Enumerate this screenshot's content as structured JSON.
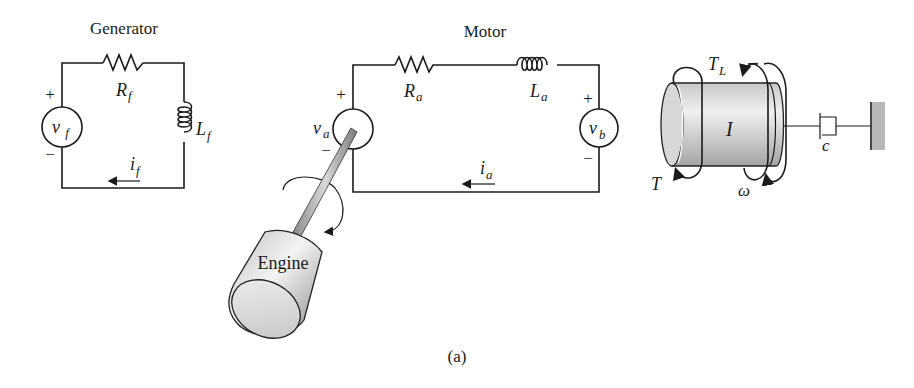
{
  "figure": {
    "caption": "(a)",
    "colors": {
      "line": "#1a1a1a",
      "cylinder_light": "#e8e8e8",
      "cylinder_dark": "#9a9a9a",
      "wall": "#b0b0b0",
      "background": "#ffffff"
    }
  },
  "generator": {
    "title": "Generator",
    "source": {
      "symbol": "v",
      "sub": "f",
      "plus": "+",
      "minus": "−"
    },
    "resistor": {
      "symbol": "R",
      "sub": "f"
    },
    "inductor": {
      "symbol": "L",
      "sub": "f"
    },
    "current": {
      "symbol": "i",
      "sub": "f",
      "direction": "left"
    }
  },
  "motor": {
    "title": "Motor",
    "armature_source": {
      "symbol": "v",
      "sub": "a",
      "plus": "+",
      "minus": "−"
    },
    "back_emf_source": {
      "symbol": "v",
      "sub": "b",
      "plus": "+",
      "minus": "−"
    },
    "resistor": {
      "symbol": "R",
      "sub": "a"
    },
    "inductor": {
      "symbol": "L",
      "sub": "a"
    },
    "current": {
      "symbol": "i",
      "sub": "a",
      "direction": "left"
    }
  },
  "engine": {
    "label": "Engine"
  },
  "load": {
    "inertia": "I",
    "load_torque": {
      "symbol": "T",
      "sub": "L"
    },
    "input_torque": {
      "symbol": "T"
    },
    "angular_velocity": {
      "symbol": "ω"
    },
    "damper": {
      "symbol": "c"
    }
  }
}
